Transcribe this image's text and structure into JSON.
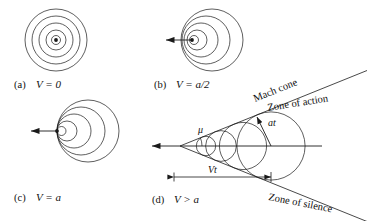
{
  "figure": {
    "panels": [
      {
        "id": "a",
        "caption_prefix": "(a)",
        "caption_value": "V = 0",
        "condition": "V = 0",
        "description": "Concentric circular wavefronts about a stationary source",
        "source_moving": false,
        "num_wavefronts": 4,
        "wave_radii": [
          8,
          16,
          24,
          32
        ],
        "center": {
          "x": 56,
          "y": 40
        },
        "source_dot_radius": 1.9
      },
      {
        "id": "b",
        "caption_prefix": "(b)",
        "caption_value": "V = a/2",
        "condition": "V = a/2",
        "description": "Subsonic source: wavefronts bunch ahead of the source",
        "source_moving": true,
        "arrow_direction": "left",
        "num_wavefronts": 4,
        "wave_radii": [
          8,
          16,
          24,
          32
        ],
        "center_offsets": [
          4,
          8,
          12,
          16
        ],
        "center": {
          "x": 196,
          "y": 40
        },
        "source_dot_radius": 1.9
      },
      {
        "id": "c",
        "caption_prefix": "(c)",
        "caption_value": "V = a",
        "condition": "V = a",
        "description": "Sonic source: all wavefronts tangent at the source point",
        "source_moving": true,
        "arrow_direction": "left",
        "num_wavefronts": 4,
        "wave_radii": [
          8,
          16,
          24,
          32
        ],
        "center_offsets": [
          8,
          16,
          24,
          32
        ],
        "center": {
          "x": 56,
          "y": 131
        },
        "source_dot_radius": 1.9
      },
      {
        "id": "d",
        "caption_prefix": "(d)",
        "caption_value": "V > a",
        "condition": "V > a",
        "description": "Supersonic source: wavefronts form a Mach cone",
        "source_moving": true,
        "arrow_direction": "left",
        "num_wavefronts": 4,
        "apex": {
          "x": 180,
          "y": 146
        },
        "mach_angle_deg": 22,
        "annotations": {
          "mach_angle_symbol": "μ",
          "mach_cone": "Mach cone",
          "zone_of_action": "Zone of action",
          "zone_of_silence": "Zone of silence",
          "sound_radius": "at",
          "source_distance": "Vt"
        }
      }
    ],
    "colors": {
      "line": "#1a1a1a",
      "background": "#ffffff",
      "text": "#111111"
    }
  }
}
